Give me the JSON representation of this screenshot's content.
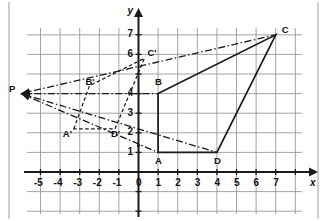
{
  "figure": {
    "kind": "coordinate-plane-dilation-diagram",
    "background": "#ffffff",
    "paper_edge_color": "#b9b9b9",
    "grid_color": "#8d8d8d",
    "axis_color": "#1a1a1a",
    "shape_color": "#1a1a1a",
    "axes": {
      "x_label": "x",
      "y_label": "y",
      "x_ticks": [
        "-6",
        "-5",
        "-4",
        "-3",
        "-2",
        "-1",
        "0",
        "1",
        "2",
        "3",
        "4",
        "5",
        "6",
        "7"
      ],
      "y_ticks": [
        "1",
        "2",
        "3",
        "4",
        "6",
        "7"
      ],
      "x_range": [
        -7,
        8
      ],
      "y_range": [
        -2,
        8
      ],
      "grid": true
    },
    "points": [
      {
        "name": "P",
        "label": "P",
        "x": -6.0,
        "y": 4.0,
        "label_dx": -12,
        "label_dy": -5
      },
      {
        "name": "A",
        "label": "A",
        "x": 1.0,
        "y": 1.0,
        "label_dx": -3,
        "label_dy": 9
      },
      {
        "name": "B",
        "label": "B",
        "x": 1.0,
        "y": 4.0,
        "label_dx": -3,
        "label_dy": -12
      },
      {
        "name": "C",
        "label": "C",
        "x": 7.0,
        "y": 7.0,
        "label_dx": 6,
        "label_dy": -5
      },
      {
        "name": "D",
        "label": "D",
        "x": 4.0,
        "y": 1.0,
        "label_dx": -3,
        "label_dy": 9
      },
      {
        "name": "A'",
        "label": "A'",
        "x": -3.3,
        "y": 2.2,
        "label_dx": -11,
        "label_dy": 5
      },
      {
        "name": "B'",
        "label": "B'",
        "x": -2.5,
        "y": 4.4,
        "label_dx": -4,
        "label_dy": -4
      },
      {
        "name": "C'",
        "label": "C'",
        "x": 0.3,
        "y": 5.8,
        "label_dx": 3,
        "label_dy": -5
      },
      {
        "name": "D'",
        "label": "D'",
        "x": -1.2,
        "y": 2.2,
        "label_dx": -4,
        "label_dy": 5
      }
    ],
    "solid_polygon": {
      "name": "quadrilateral-ABCD",
      "vertices": [
        "A",
        "B",
        "C",
        "D"
      ],
      "style": "solid"
    },
    "dashed_polygon": {
      "name": "quadrilateral-A'B'C'D'",
      "vertices": [
        "A'",
        "B'",
        "C'",
        "D'"
      ],
      "style": "dashed"
    },
    "projection_rays": {
      "name": "dash-dot-rays-from-P",
      "from": "P",
      "to": [
        "A",
        "B",
        "C",
        "D"
      ],
      "style": "dash-dot",
      "arrowheads_at": "P"
    }
  }
}
